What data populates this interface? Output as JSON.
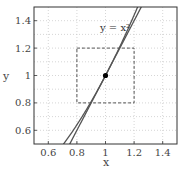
{
  "chart_data": {
    "type": "line",
    "title": "",
    "xlabel": "x",
    "ylabel": "y",
    "xlim": [
      0.5,
      1.5
    ],
    "ylim": [
      0.5,
      1.5
    ],
    "xticks": [
      0.6,
      0.8,
      1.0,
      1.2,
      1.4
    ],
    "xtick_labels": [
      "0.6",
      "0.8",
      "1",
      "1.2",
      "1.4"
    ],
    "yticks": [
      0.6,
      0.8,
      1.0,
      1.2,
      1.4
    ],
    "ytick_labels": [
      "0.6",
      "0.8",
      "1",
      "1.2",
      "1.4"
    ],
    "grid": true,
    "minor_grid_y": [
      0.7,
      0.9,
      1.1,
      1.3
    ],
    "series": [
      {
        "name": "y = x^2",
        "kind": "curve",
        "function": "x^2",
        "color": "#555555"
      },
      {
        "name": "tangent at (1,1)",
        "kind": "line",
        "function": "2x - 1",
        "color": "#555555"
      }
    ],
    "points": [
      {
        "x": 1,
        "y": 1,
        "color": "#000000"
      }
    ],
    "annotations": [
      {
        "text": "y = x²",
        "x": 0.97,
        "y": 1.33
      },
      {
        "type": "dashed-rectangle",
        "x0": 0.8,
        "x1": 1.2,
        "y0": 0.8,
        "y1": 1.2
      }
    ],
    "legend": "none"
  },
  "labels": {
    "xlabel": "x",
    "ylabel": "y",
    "annotation": "y = x²"
  }
}
